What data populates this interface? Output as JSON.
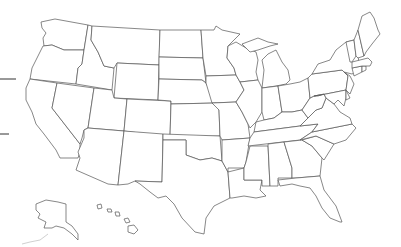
{
  "map": {
    "title": "",
    "type": "blank outline map",
    "region": "United States",
    "stroke_color": "#555555",
    "fill_color": "#ffffff",
    "background": "#ffffff",
    "states": [
      "WA",
      "OR",
      "CA",
      "ID",
      "NV",
      "MT",
      "WY",
      "UT",
      "AZ",
      "CO",
      "NM",
      "ND",
      "SD",
      "NE",
      "KS",
      "OK",
      "TX",
      "MN",
      "IA",
      "MO",
      "AR",
      "LA",
      "WI",
      "IL",
      "MS",
      "MI",
      "IN",
      "KY",
      "TN",
      "AL",
      "OH",
      "GA",
      "FL",
      "WV",
      "VA",
      "NC",
      "SC",
      "PA",
      "NY",
      "MD",
      "DE",
      "NJ",
      "CT",
      "RI",
      "MA",
      "VT",
      "NH",
      "ME",
      "AK",
      "HI"
    ],
    "insets": [
      "Alaska",
      "Hawaii"
    ],
    "left_marks": [
      {
        "y": 79,
        "x1": 0,
        "x2": 16
      },
      {
        "y": 134,
        "x1": 0,
        "x2": 9
      }
    ]
  }
}
